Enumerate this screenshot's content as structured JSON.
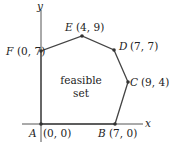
{
  "axes": {
    "x_label": "x",
    "y_label": "y"
  },
  "region_label": {
    "line1": "feasible",
    "line2": "set"
  },
  "vertices": [
    {
      "name": "A",
      "coords": "(0, 0)"
    },
    {
      "name": "B",
      "coords": "(7, 0)"
    },
    {
      "name": "C",
      "coords": "(9, 4)"
    },
    {
      "name": "D",
      "coords": "(7, 7)"
    },
    {
      "name": "E",
      "coords": "(4, 9)"
    },
    {
      "name": "F",
      "coords": "(0, 7)"
    }
  ]
}
